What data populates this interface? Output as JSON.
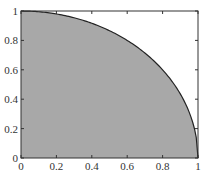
{
  "chart_data": {
    "type": "area",
    "title": "",
    "xlabel": "",
    "ylabel": "",
    "xlim": [
      0,
      1
    ],
    "ylim": [
      0,
      1
    ],
    "grid": false,
    "legend": null,
    "x": [
      0,
      0.1,
      0.2,
      0.3,
      0.4,
      0.5,
      0.6,
      0.7,
      0.8,
      0.9,
      0.95,
      1.0
    ],
    "series": [
      {
        "name": "quarter-circle",
        "values": [
          1.0,
          0.995,
          0.98,
          0.954,
          0.917,
          0.866,
          0.8,
          0.714,
          0.6,
          0.436,
          0.312,
          0.0
        ]
      }
    ],
    "xticks": [
      "0",
      "0.2",
      "0.4",
      "0.6",
      "0.8",
      "1"
    ],
    "yticks": [
      "0",
      "0.2",
      "0.4",
      "0.6",
      "0.8",
      "1"
    ],
    "colors": {
      "fill": "#a8a8a8",
      "edge": "#222222",
      "axes": "#333333"
    }
  }
}
